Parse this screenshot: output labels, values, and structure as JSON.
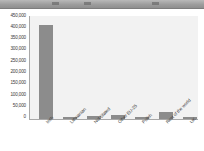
{
  "toolbar": {
    "present": true,
    "glyphs": [
      "toolbar-glyph-1",
      "toolbar-glyph-2",
      "toolbar-glyph-3"
    ]
  },
  "colors": {
    "bar": "#8c8c8c",
    "plot_background": "#f2f2f2",
    "axis": "#a8a8a8",
    "text": "#3a3a3a",
    "page_background": "#ffffff"
  },
  "chart_data": {
    "type": "bar",
    "title": "",
    "subtitle": "",
    "xlabel": "",
    "ylabel": "",
    "orientation": "vertical",
    "grid": false,
    "legend": null,
    "ylim": [
      0,
      450000
    ],
    "ytick_step": 50000,
    "ytick_labels": [
      "450,000",
      "400,000",
      "350,000",
      "300,000",
      "250,000",
      "200,000",
      "150,000",
      "100,000",
      "50,000",
      "0"
    ],
    "ytick_values": [
      450000,
      400000,
      350000,
      300000,
      250000,
      200000,
      150000,
      100000,
      50000,
      0
    ],
    "categories": [
      "Irish",
      "Lithuanian",
      "Not Stated",
      "Other EU-25",
      "Polish",
      "Rest of the world",
      "UK"
    ],
    "values": [
      410000,
      8000,
      15000,
      18000,
      10000,
      30000,
      8000
    ],
    "xtick_rotation_degrees": -45,
    "series": [
      {
        "name": "Nationality",
        "values": [
          410000,
          8000,
          15000,
          18000,
          10000,
          30000,
          8000
        ]
      }
    ]
  }
}
